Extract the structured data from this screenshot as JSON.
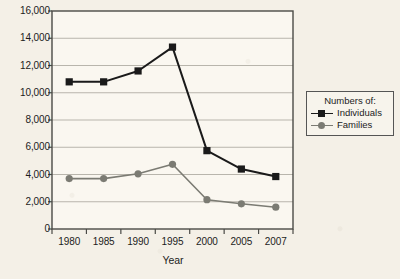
{
  "chart_data": {
    "type": "line",
    "title": "",
    "xlabel": "Year",
    "ylabel": "",
    "categories": [
      "1980",
      "1985",
      "1990",
      "1995",
      "2000",
      "2005",
      "2007"
    ],
    "series": [
      {
        "name": "Individuals",
        "marker": "square",
        "color": "#1a1a1a",
        "values": [
          10800,
          10800,
          11600,
          13350,
          5750,
          4400,
          3850
        ]
      },
      {
        "name": "Families",
        "marker": "circle",
        "color": "#7b7b73",
        "values": [
          3700,
          3700,
          4050,
          4750,
          2150,
          1850,
          1600
        ]
      }
    ],
    "ylim": [
      0,
      16000
    ],
    "yticks": [
      "0",
      "2,000",
      "4,000",
      "6,000",
      "8,000",
      "10,000",
      "12,000",
      "14,000",
      "16,000"
    ],
    "ytick_values": [
      0,
      2000,
      4000,
      6000,
      8000,
      10000,
      12000,
      14000,
      16000
    ],
    "grid": "horizontal",
    "legend_position": "right-outside",
    "legend": {
      "title": "Numbers of:",
      "entries": [
        "Individuals",
        "Families"
      ]
    }
  },
  "colors": {
    "page_background": "#f4f0e7",
    "plot_background": "#faf7f0",
    "frame": "#4a4a46",
    "gridline": "#b8b5ac",
    "individuals": "#1a1a1a",
    "families": "#7b7b73",
    "text": "#1c1c1c"
  }
}
